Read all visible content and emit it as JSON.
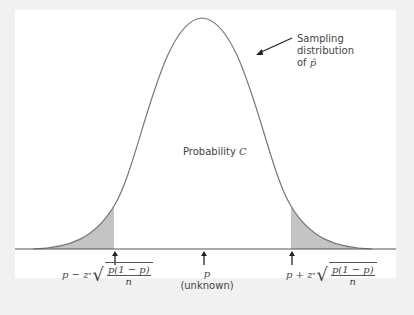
{
  "diagram": {
    "type": "normal-distribution-confidence-interval",
    "colors": {
      "background": "#f1f1f1",
      "panel": "#ffffff",
      "curve": "#777777",
      "shaded_tail": "#c4c4c4",
      "baseline": "#555555",
      "arrow": "#222222"
    },
    "annotation": {
      "line1": "Sampling",
      "line2": "distribution",
      "line3_prefix": "of",
      "line3_symbol": "p̂"
    },
    "center_area_label": {
      "text": "Probability",
      "symbol": "C"
    },
    "markers": {
      "left": {
        "prefix": "p − z",
        "superscript": "*",
        "numerator": "p(1 − p)",
        "denominator": "n"
      },
      "center": {
        "symbol": "p",
        "note": "(unknown)"
      },
      "right": {
        "prefix": "p + z",
        "superscript": "*",
        "numerator": "p(1 − p)",
        "denominator": "n"
      }
    }
  }
}
